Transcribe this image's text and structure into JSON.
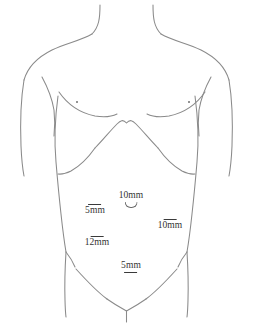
{
  "diagram": {
    "line_color": "#8a8a8a",
    "marker_color": "#3a3a3a",
    "text_color": "#333333",
    "background": "#ffffff",
    "width": 253,
    "height": 332
  },
  "ports": [
    {
      "id": "umbilical",
      "label": "10mm",
      "size_mm": 10,
      "position": "umbilical",
      "marker_position": "below-text",
      "has_umbilicus_glyph": true,
      "x": 131,
      "y": 198
    },
    {
      "id": "left-upper",
      "label": "5mm",
      "size_mm": 5,
      "position": "left upper quadrant",
      "marker_position": "above-text",
      "has_umbilicus_glyph": false,
      "x": 95,
      "y": 217
    },
    {
      "id": "right-lateral",
      "label": "10mm",
      "size_mm": 10,
      "position": "right lateral",
      "marker_position": "above-text",
      "has_umbilicus_glyph": false,
      "x": 170,
      "y": 231
    },
    {
      "id": "left-lower",
      "label": "12mm",
      "size_mm": 12,
      "position": "left lower quadrant",
      "marker_position": "above-text",
      "has_umbilicus_glyph": false,
      "x": 97,
      "y": 248
    },
    {
      "id": "suprapubic",
      "label": "5mm",
      "size_mm": 5,
      "position": "suprapubic midline",
      "marker_position": "below-text",
      "has_umbilicus_glyph": false,
      "x": 131,
      "y": 265
    }
  ],
  "anatomy_marks": [
    {
      "id": "nipple-left",
      "name": "left nipple",
      "x": 76,
      "y": 101
    },
    {
      "id": "nipple-right",
      "name": "right nipple",
      "x": 188,
      "y": 101
    }
  ]
}
